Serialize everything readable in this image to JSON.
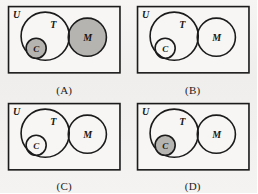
{
  "figure": {
    "kind": "venn-diagram-multiple-choice",
    "background_color": "#f2f1ef",
    "stroke_color": "#1b1b1b",
    "shade_color": "#b6b4b0",
    "unshaded_color": "#f7f6f4",
    "panel_count": 4
  },
  "labels": {
    "universe": "U",
    "set_t": "T",
    "set_m": "M",
    "set_c": "C"
  },
  "panels": [
    {
      "id": "A",
      "caption": "(A)",
      "shaded_regions": [
        "C",
        "M"
      ],
      "description": "Circle C shaded and entire circle M shaded including the T and M overlap",
      "regions": {
        "T_only": "unshaded",
        "C": "shaded",
        "T_and_M": "shaded",
        "M_only": "shaded",
        "U_outside": "unshaded"
      }
    },
    {
      "id": "B",
      "caption": "(B)",
      "shaded_regions": [
        "T_and_M"
      ],
      "description": "Only the lens shaped intersection of T and M is shaded",
      "regions": {
        "T_only": "unshaded",
        "C": "unshaded",
        "T_and_M": "shaded",
        "M_only": "unshaded",
        "U_outside": "unshaded"
      }
    },
    {
      "id": "C",
      "caption": "(C)",
      "shaded_regions": [],
      "description": "No region is shaded",
      "regions": {
        "T_only": "unshaded",
        "C": "unshaded",
        "T_and_M": "unshaded",
        "M_only": "unshaded",
        "U_outside": "unshaded"
      }
    },
    {
      "id": "D",
      "caption": "(D)",
      "shaded_regions": [
        "C"
      ],
      "description": "Only circle C inside T is shaded",
      "regions": {
        "T_only": "unshaded",
        "C": "shaded",
        "T_and_M": "unshaded",
        "M_only": "unshaded",
        "U_outside": "unshaded"
      }
    }
  ],
  "geometry": {
    "rect": {
      "x": 4,
      "y": 3,
      "w": 111,
      "h": 66
    },
    "circle_t": {
      "cx": 45,
      "cy": 36,
      "r": 24
    },
    "circle_m": {
      "cx": 87,
      "cy": 37,
      "r": 19
    },
    "circle_c": {
      "cx": 36,
      "cy": 48,
      "r": 10
    },
    "label_u": {
      "x": 11,
      "y": 15
    },
    "label_t": {
      "x": 49,
      "y": 27
    },
    "label_m": {
      "x": 84,
      "y": 41
    },
    "label_c": {
      "x": 33,
      "y": 52
    }
  }
}
